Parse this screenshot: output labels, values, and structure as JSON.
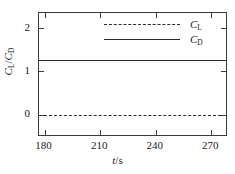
{
  "chart_data": {
    "type": "line",
    "title": "",
    "xlabel": "t/s",
    "ylabel": "C_L/C_D",
    "xlabel_parts": {
      "var": "t",
      "rest": "/s"
    },
    "ylabel_parts": {
      "num_var": "C",
      "num_sub": "L",
      "slash": "/",
      "den_var": "C",
      "den_sub": "D"
    },
    "xlim": [
      177,
      279
    ],
    "ylim": [
      -0.52,
      2.35
    ],
    "xticks": [
      180,
      210,
      240,
      270
    ],
    "yticks": [
      0,
      1,
      2
    ],
    "xtick_labels": [
      "180",
      "210",
      "240",
      "270"
    ],
    "ytick_labels": [
      "0",
      "1",
      "2"
    ],
    "grid": false,
    "legend_position": "top-right",
    "series": [
      {
        "name": "C_L",
        "label_var": "C",
        "label_sub": "L",
        "style": "dashed",
        "color": "#2a2a2a",
        "constant_value": 0.0,
        "x": [
          180,
          195,
          210,
          225,
          240,
          255,
          270,
          279
        ],
        "values": [
          0.0,
          0.0,
          0.0,
          0.0,
          0.0,
          0.0,
          0.0,
          0.0
        ]
      },
      {
        "name": "C_D",
        "label_var": "C",
        "label_sub": "D",
        "style": "solid",
        "color": "#2a2a2a",
        "constant_value": 1.27,
        "x": [
          180,
          195,
          210,
          225,
          240,
          255,
          270,
          279
        ],
        "values": [
          1.27,
          1.27,
          1.27,
          1.27,
          1.27,
          1.27,
          1.27,
          1.27
        ]
      }
    ]
  }
}
